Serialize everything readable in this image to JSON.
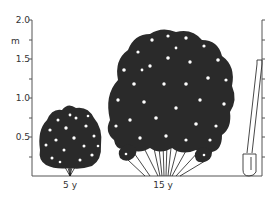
{
  "figure": {
    "y_axis": {
      "unit": "m",
      "ticks": [
        {
          "value": 2.0,
          "label": "2.0",
          "y": 20
        },
        {
          "value": 1.5,
          "label": "1.5",
          "y": 59
        },
        {
          "value": 1.0,
          "label": "1.0",
          "y": 98
        },
        {
          "value": 0.5,
          "label": "0.5",
          "y": 137
        }
      ],
      "minor_tick_interval": 0.25,
      "range": [
        0,
        2.0
      ]
    },
    "plants": [
      {
        "id": "shrub",
        "age_label": "5 y",
        "height_m": 0.9,
        "center_x": 70
      },
      {
        "id": "bamboo",
        "age_label": "15 y",
        "height_m": 1.9,
        "center_x": 163
      }
    ],
    "scale_object": {
      "name": "spade",
      "height_m": 1.5
    },
    "colors": {
      "ink": "#1a1a1a",
      "axis": "#555555",
      "background": "#ffffff"
    }
  }
}
